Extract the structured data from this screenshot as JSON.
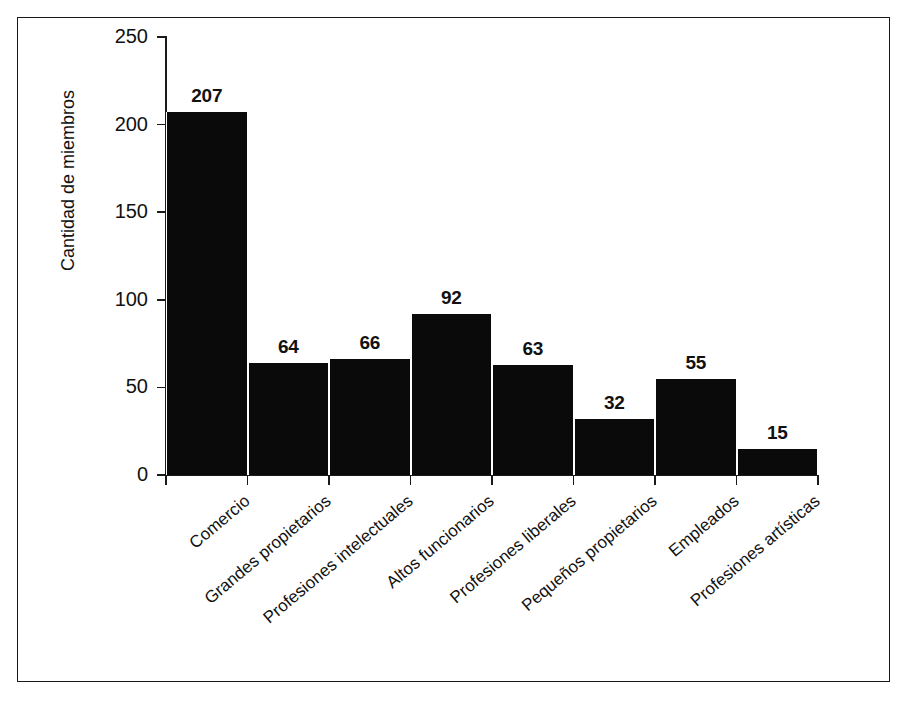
{
  "chart_data": {
    "type": "bar",
    "title": "",
    "subtitle": "",
    "xlabel": "",
    "ylabel": "Cantidad de miembros",
    "categories": [
      "Comercio",
      "Grandes propietarios",
      "Profesiones intelectuales",
      "Altos funcionarios",
      "Profesiones liberales",
      "Pequeños propietarios",
      "Empleados",
      "Profesiones artísticas"
    ],
    "values": [
      207,
      64,
      66,
      92,
      63,
      32,
      55,
      15
    ],
    "ylim": [
      0,
      250
    ],
    "yticks": [
      0,
      50,
      100,
      150,
      200,
      250
    ],
    "ytick_labels": [
      "0",
      "50",
      "100",
      "150",
      "200",
      "250"
    ],
    "grid": false,
    "legend": null,
    "bar_color": "#0a0a0a",
    "axis_color": "#1a1a1a",
    "background_color": "#ffffff",
    "data_labels_shown": true
  },
  "figure": {
    "border_color": "#1a1a1a",
    "background_color": "#ffffff"
  }
}
